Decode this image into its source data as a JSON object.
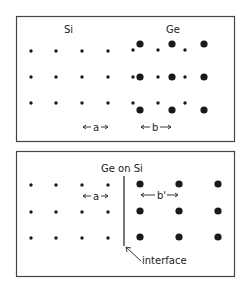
{
  "top_panel": {
    "label_left": "Si",
    "label_right": "Ge",
    "spacing_a": "a",
    "spacing_b": "b",
    "si_atoms": [
      [
        31,
        51
      ],
      [
        56,
        51
      ],
      [
        82,
        51
      ],
      [
        108,
        51
      ],
      [
        31,
        77
      ],
      [
        56,
        77
      ],
      [
        82,
        77
      ],
      [
        108,
        77
      ],
      [
        31,
        103
      ],
      [
        56,
        103
      ],
      [
        82,
        103
      ],
      [
        108,
        103
      ]
    ],
    "ge_small_atoms": [
      [
        133,
        50
      ],
      [
        158,
        50
      ],
      [
        185,
        50
      ],
      [
        133,
        77
      ],
      [
        158,
        77
      ],
      [
        185,
        77
      ],
      [
        133,
        103
      ],
      [
        158,
        103
      ],
      [
        185,
        103
      ]
    ],
    "ge_large_atoms": [
      [
        140,
        44
      ],
      [
        172,
        44
      ],
      [
        204,
        44
      ],
      [
        140,
        77
      ],
      [
        172,
        77
      ],
      [
        204,
        77
      ],
      [
        140,
        110
      ],
      [
        172,
        110
      ],
      [
        204,
        110
      ]
    ]
  },
  "bottom_panel": {
    "title": "Ge on Si",
    "spacing_a": "a",
    "spacing_b_prime": "b'",
    "interface_label": "interface",
    "si_atoms": [
      [
        31,
        185
      ],
      [
        56,
        185
      ],
      [
        82,
        185
      ],
      [
        108,
        185
      ],
      [
        31,
        212
      ],
      [
        56,
        212
      ],
      [
        82,
        212
      ],
      [
        108,
        212
      ],
      [
        31,
        238
      ],
      [
        56,
        238
      ],
      [
        82,
        238
      ],
      [
        108,
        238
      ]
    ],
    "ge_atoms": [
      [
        140,
        184
      ],
      [
        179,
        184
      ],
      [
        218,
        184
      ],
      [
        140,
        211
      ],
      [
        179,
        211
      ],
      [
        218,
        211
      ],
      [
        140,
        237
      ],
      [
        179,
        237
      ],
      [
        218,
        237
      ]
    ]
  },
  "colors": {
    "ink": "#1a1a1a",
    "frame": "#444444"
  }
}
